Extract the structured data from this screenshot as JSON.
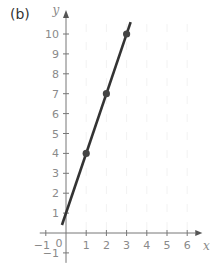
{
  "panel_label": "(b)",
  "colors": {
    "axis": "#777777",
    "tick_text": "#8a8a8a",
    "line": "#333333",
    "point": "#444444",
    "grid": "#f2f2f2"
  },
  "chart_data": {
    "type": "line",
    "title": "",
    "panel": "(b)",
    "xlabel": "x",
    "ylabel": "y",
    "xlim": [
      -1,
      6
    ],
    "ylim": [
      -1,
      10
    ],
    "x_ticks": [
      -1,
      0,
      1,
      2,
      3,
      4,
      5,
      6
    ],
    "y_ticks": [
      -1,
      1,
      2,
      3,
      4,
      5,
      6,
      7,
      8,
      9,
      10
    ],
    "origin_label": "0",
    "grid": false,
    "legend": null,
    "series": [
      {
        "name": "line",
        "equation": "y = 3x + 1",
        "x": [
          -0.2,
          3.2
        ],
        "y": [
          0.4,
          10.6
        ]
      }
    ],
    "points": [
      {
        "x": 1,
        "y": 4
      },
      {
        "x": 2,
        "y": 7
      },
      {
        "x": 3,
        "y": 10
      }
    ]
  }
}
